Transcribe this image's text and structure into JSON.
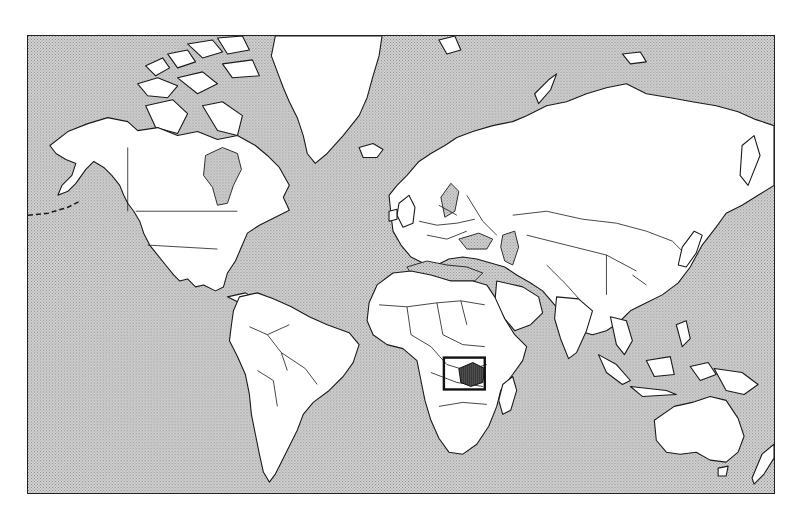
{
  "map": {
    "type": "world locator map",
    "projection": "Mercator",
    "style": "black and white, stippled ocean",
    "highlighted_country": "Zimbabwe",
    "locator_box": {
      "region": "Southern Africa",
      "x": 444,
      "y": 358,
      "width": 41,
      "height": 32
    },
    "colors": {
      "land": "#ffffff",
      "ocean": "#c8c8c8",
      "outline": "#1a1a1a",
      "highlight": "#3a3a3a"
    },
    "regions": [
      "North America",
      "Greenland",
      "South America",
      "Europe",
      "Africa",
      "Asia",
      "Australia",
      "New Zealand",
      "Madagascar",
      "Antarctic-free frame"
    ]
  }
}
